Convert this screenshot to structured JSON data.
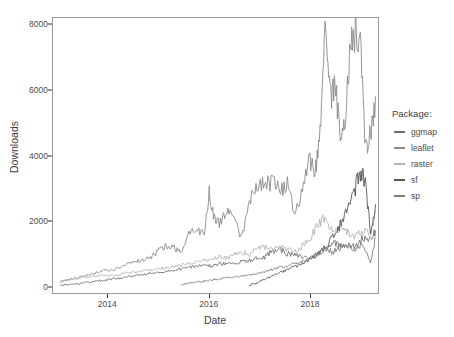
{
  "chart_data": {
    "type": "line",
    "title": "",
    "xlabel": "Date",
    "ylabel": "Downloads",
    "xlim": [
      2012.9,
      2019.35
    ],
    "ylim": [
      -200,
      8200
    ],
    "xticks": [
      2014,
      2016,
      2018
    ],
    "xtick_labels": [
      "2014",
      "2016",
      "2018"
    ],
    "yticks": [
      0,
      2000,
      4000,
      6000,
      8000
    ],
    "ytick_labels": [
      "0",
      "2000",
      "4000",
      "6000",
      "8000"
    ],
    "grid": false,
    "legend_position": "right",
    "legend_title": "Package:",
    "series": [
      {
        "name": "ggmap",
        "color": "#6f6f6f",
        "x": [
          2013.05,
          2013.2,
          2013.35,
          2013.5,
          2013.65,
          2013.8,
          2013.95,
          2014.1,
          2014.25,
          2014.4,
          2014.55,
          2014.7,
          2014.85,
          2015.0,
          2015.15,
          2015.3,
          2015.45,
          2015.6,
          2015.75,
          2015.9,
          2016.05,
          2016.2,
          2016.35,
          2016.5,
          2016.65,
          2016.8,
          2016.95,
          2017.1,
          2017.25,
          2017.4,
          2017.55,
          2017.7,
          2017.85,
          2018.0,
          2018.15,
          2018.3,
          2018.45,
          2018.6,
          2018.75,
          2018.9,
          2019.05,
          2019.2,
          2019.3
        ],
        "y": [
          40,
          60,
          80,
          110,
          140,
          170,
          200,
          230,
          260,
          300,
          330,
          360,
          400,
          430,
          470,
          500,
          540,
          580,
          620,
          660,
          620,
          680,
          700,
          720,
          760,
          800,
          850,
          900,
          1080,
          1150,
          1000,
          950,
          900,
          880,
          1000,
          1150,
          1350,
          1300,
          1250,
          1200,
          1500,
          1450,
          1700
        ]
      },
      {
        "name": "leaflet",
        "color": "#8a8a8a",
        "x": [
          2013.05,
          2013.2,
          2013.35,
          2013.5,
          2013.65,
          2013.8,
          2013.95,
          2014.1,
          2014.25,
          2014.4,
          2014.55,
          2014.7,
          2014.85,
          2015.0,
          2015.15,
          2015.3,
          2015.45,
          2015.6,
          2015.75,
          2015.9,
          2016.0,
          2016.1,
          2016.2,
          2016.35,
          2016.5,
          2016.65,
          2016.8,
          2016.95,
          2017.1,
          2017.25,
          2017.4,
          2017.55,
          2017.7,
          2017.85,
          2018.0,
          2018.1,
          2018.2,
          2018.3,
          2018.4,
          2018.5,
          2018.6,
          2018.7,
          2018.8,
          2018.9,
          2019.0,
          2019.1,
          2019.2,
          2019.3
        ],
        "y": [
          150,
          200,
          260,
          320,
          380,
          430,
          520,
          480,
          620,
          700,
          760,
          820,
          900,
          1100,
          1250,
          1180,
          1050,
          1700,
          1800,
          1550,
          2900,
          2100,
          1900,
          2400,
          2000,
          1500,
          2700,
          3050,
          3100,
          3200,
          2900,
          3100,
          2200,
          3000,
          3900,
          3400,
          4600,
          7800,
          5800,
          6200,
          4600,
          5000,
          7400,
          7700,
          7300,
          4200,
          4600,
          5800
        ]
      },
      {
        "name": "raster",
        "color": "#b4b4b4",
        "x": [
          2013.05,
          2013.2,
          2013.35,
          2013.5,
          2013.65,
          2013.8,
          2013.95,
          2014.1,
          2014.25,
          2014.4,
          2014.55,
          2014.7,
          2014.85,
          2015.0,
          2015.15,
          2015.3,
          2015.45,
          2015.6,
          2015.75,
          2015.9,
          2016.05,
          2016.2,
          2016.35,
          2016.5,
          2016.65,
          2016.8,
          2016.95,
          2017.1,
          2017.25,
          2017.4,
          2017.55,
          2017.7,
          2017.85,
          2018.0,
          2018.15,
          2018.3,
          2018.45,
          2018.6,
          2018.75,
          2018.9,
          2019.05,
          2019.2,
          2019.3
        ],
        "y": [
          160,
          200,
          230,
          270,
          300,
          320,
          350,
          330,
          380,
          420,
          450,
          470,
          500,
          540,
          580,
          620,
          660,
          700,
          760,
          800,
          820,
          900,
          860,
          1000,
          1050,
          980,
          1150,
          1200,
          1100,
          1180,
          1150,
          1050,
          1250,
          1400,
          1950,
          2050,
          1700,
          1800,
          1650,
          1500,
          1700,
          1600,
          2300
        ]
      },
      {
        "name": "sf",
        "color": "#555555",
        "x": [
          2016.8,
          2016.95,
          2017.1,
          2017.25,
          2017.4,
          2017.55,
          2017.7,
          2017.85,
          2018.0,
          2018.15,
          2018.3,
          2018.45,
          2018.6,
          2018.75,
          2018.9,
          2019.0,
          2019.1,
          2019.2,
          2019.3
        ],
        "y": [
          30,
          120,
          220,
          330,
          420,
          520,
          600,
          700,
          800,
          1000,
          1200,
          1500,
          1900,
          2400,
          3000,
          3500,
          3200,
          1700,
          2500
        ]
      },
      {
        "name": "sp",
        "color": "#7e7e7e",
        "x": [
          2015.45,
          2015.6,
          2015.75,
          2015.9,
          2016.05,
          2016.2,
          2016.35,
          2016.5,
          2016.65,
          2016.8,
          2016.95,
          2017.1,
          2017.25,
          2017.4,
          2017.55,
          2017.7,
          2017.85,
          2018.0,
          2018.15,
          2018.3,
          2018.45,
          2018.6,
          2018.75,
          2018.9,
          2019.05,
          2019.2,
          2019.3
        ],
        "y": [
          50,
          90,
          130,
          170,
          200,
          230,
          260,
          290,
          320,
          350,
          400,
          450,
          520,
          600,
          620,
          700,
          780,
          850,
          1000,
          1150,
          1050,
          1200,
          1250,
          1150,
          1300,
          700,
          1500
        ]
      }
    ]
  },
  "legend": {
    "title": "Package:",
    "items": [
      {
        "label": "ggmap",
        "color": "#6f6f6f"
      },
      {
        "label": "leaflet",
        "color": "#8a8a8a"
      },
      {
        "label": "raster",
        "color": "#b4b4b4"
      },
      {
        "label": "sf",
        "color": "#555555"
      },
      {
        "label": "sp",
        "color": "#7e7e7e"
      }
    ]
  },
  "axes": {
    "x_title": "Date",
    "y_title": "Downloads"
  }
}
